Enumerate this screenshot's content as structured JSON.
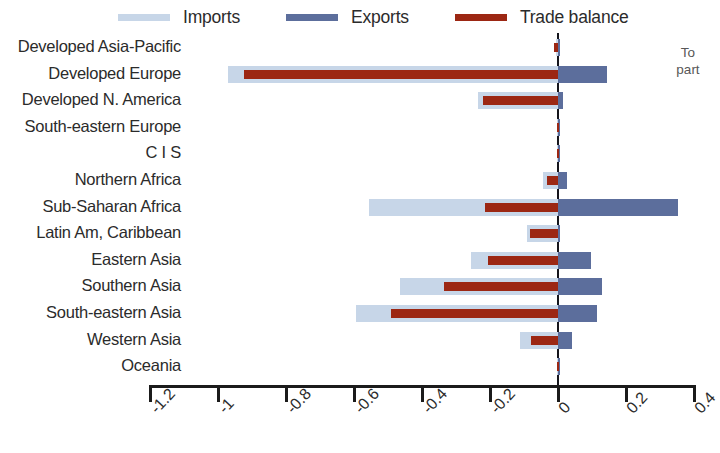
{
  "chart_data": {
    "type": "bar",
    "orientation": "horizontal",
    "title": "",
    "subtitle": "",
    "xlabel": "",
    "ylabel": "",
    "xlim": [
      -1.3,
      0.45
    ],
    "grid": false,
    "legend_position": "top",
    "legend": [
      {
        "name": "Imports",
        "color": "#c7d6e8"
      },
      {
        "name": "Exports",
        "color": "#5c6e9c"
      },
      {
        "name": "Trade balance",
        "color": "#9c2713"
      }
    ],
    "xticks": [
      -1.2,
      -1.0,
      -0.8,
      -0.6,
      -0.4,
      -0.2,
      0.0,
      0.2,
      0.4
    ],
    "xtick_labels": [
      "-1.2",
      "-1",
      "-0.8",
      "-0.6",
      "-0.4",
      "-0.2",
      "0",
      "0.2",
      "0.4"
    ],
    "categories": [
      "Developed Asia-Pacific",
      "Developed Europe",
      "Developed N. America",
      "South-eastern Europe",
      "C I S",
      "Northern Africa",
      "Sub-Saharan Africa",
      "Latin Am, Caribbean",
      "Eastern Asia",
      "Southern Asia",
      "South-eastern Asia",
      "Western Asia",
      "Oceania"
    ],
    "series": [
      {
        "name": "Imports",
        "color": "#c7d6e8",
        "values": [
          -0.005,
          -0.97,
          -0.235,
          -0.003,
          -0.002,
          -0.045,
          -0.555,
          -0.09,
          -0.255,
          -0.465,
          -0.595,
          -0.112,
          -0.002
        ]
      },
      {
        "name": "Exports",
        "color": "#5c6e9c",
        "values": [
          0.004,
          0.145,
          0.015,
          0.002,
          0.001,
          0.027,
          0.352,
          0.004,
          0.098,
          0.128,
          0.115,
          0.042,
          0.001
        ]
      },
      {
        "name": "Trade balance",
        "color": "#9c2713",
        "values": [
          -0.012,
          -0.925,
          -0.222,
          -0.004,
          -0.002,
          -0.032,
          -0.215,
          -0.082,
          -0.205,
          -0.335,
          -0.49,
          -0.078,
          -0.002
        ]
      }
    ]
  },
  "side_note": {
    "line1": "To",
    "line2": "part"
  },
  "top_crumb": {
    "text": ""
  }
}
